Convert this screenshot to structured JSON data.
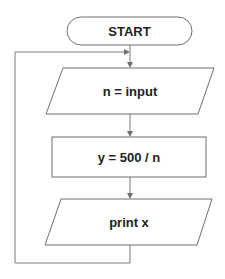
{
  "flowchart": {
    "nodes": [
      {
        "id": "start",
        "type": "terminal",
        "label": "START"
      },
      {
        "id": "input",
        "type": "io",
        "label": "n = input"
      },
      {
        "id": "process",
        "type": "process",
        "label": "y = 500 / n"
      },
      {
        "id": "output",
        "type": "io",
        "label": "print x"
      }
    ],
    "edges": [
      {
        "from": "start",
        "to": "input"
      },
      {
        "from": "input",
        "to": "process"
      },
      {
        "from": "process",
        "to": "output"
      },
      {
        "from": "output",
        "to": "input",
        "kind": "loop-back"
      }
    ],
    "colors": {
      "stroke": "#6f6f6f",
      "text": "#222222",
      "background": "#ffffff"
    }
  }
}
